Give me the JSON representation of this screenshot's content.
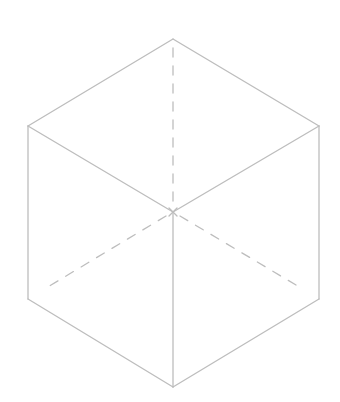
{
  "diagram": {
    "type": "isometric-cube-wireframe",
    "line_color": "#bdbdbd",
    "background": "#ffffff",
    "vertices": {
      "top": [
        173,
        39
      ],
      "upper_left": [
        28,
        126
      ],
      "upper_right": [
        319,
        126
      ],
      "center": [
        173,
        212
      ],
      "lower_left": [
        28,
        299
      ],
      "lower_right": [
        319,
        299
      ],
      "bottom": [
        173,
        387
      ],
      "hidden_back": [
        173,
        212
      ]
    },
    "solid_edges": [
      [
        "top",
        "upper_left"
      ],
      [
        "top",
        "upper_right"
      ],
      [
        "upper_left",
        "center"
      ],
      [
        "upper_right",
        "center"
      ],
      [
        "upper_left",
        "lower_left"
      ],
      [
        "upper_right",
        "lower_right"
      ],
      [
        "center",
        "bottom"
      ],
      [
        "lower_left",
        "bottom"
      ],
      [
        "lower_right",
        "bottom"
      ]
    ],
    "dashed_edges": [
      [
        "top",
        "center"
      ],
      [
        "center",
        "lower_left"
      ],
      [
        "center",
        "lower_right"
      ]
    ]
  }
}
